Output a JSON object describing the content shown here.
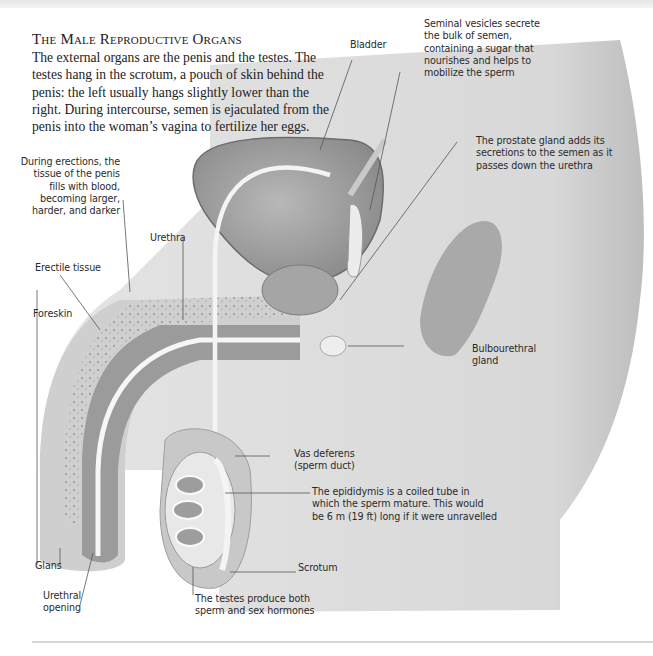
{
  "header": {
    "title": "The Male Reproductive Organs",
    "intro": "The external organs are the penis and the testes. The testes hang in the scrotum, a pouch of skin behind the penis: the left usually hangs slightly lower than the right. During intercourse, semen is ejaculated from the penis into the woman’s vagina to fertilize her eggs."
  },
  "labels": {
    "bladder": "Bladder",
    "seminal_vesicles": "Seminal vesicles secrete the bulk of semen, containing a sugar that nourishes and helps to mobilize the sperm",
    "prostate": "The prostate gland adds its secretions to the semen as it passes down the urethra",
    "erections": "During erections, the tissue of the penis fills with blood, becoming larger, harder, and darker",
    "urethra": "Urethra",
    "erectile_tissue": "Erectile tissue",
    "foreskin": "Foreskin",
    "bulbourethral": "Bulbourethral gland",
    "vas_deferens": "Vas deferens (sperm duct)",
    "epididymis": "The epididymis is a coiled tube in which the sperm mature. This would be 6 m (19 ft) long if it were unravelled",
    "scrotum": "Scrotum",
    "testes": "The testes produce both sperm and sex hormones",
    "glans": "Glans",
    "urethral_opening": "Urethral opening"
  },
  "colors": {
    "skin": "#d9d9d9",
    "skin_light": "#e8e8e8",
    "organ_dark": "#8c8c8c",
    "organ_mid": "#a8a8a8",
    "duct": "#f4f4f4",
    "leader": "#555555",
    "text": "#222222"
  }
}
